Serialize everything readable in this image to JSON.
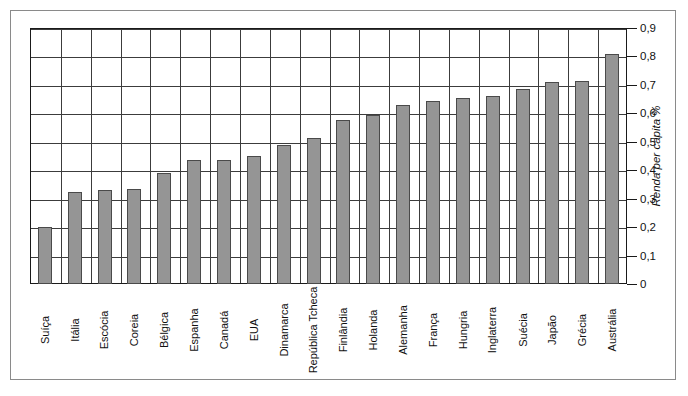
{
  "chart_data": {
    "type": "bar",
    "title": "",
    "xlabel": "",
    "ylabel": "Renda per capita %",
    "ylim": [
      0,
      0.9
    ],
    "grid": true,
    "legend": "none",
    "decimal_separator": ",",
    "categories": [
      "Suíça",
      "Itália",
      "Escócia",
      "Coreia",
      "Bélgica",
      "Espanha",
      "Canadá",
      "EUA",
      "Dinamarca",
      "República Tcheca",
      "Finlândia",
      "Holanda",
      "Alemanha",
      "França",
      "Hungria",
      "Inglaterra",
      "Suécia",
      "Japão",
      "Grécia",
      "Austrália"
    ],
    "values": [
      0.2,
      0.325,
      0.33,
      0.335,
      0.39,
      0.435,
      0.435,
      0.45,
      0.49,
      0.515,
      0.575,
      0.595,
      0.63,
      0.645,
      0.655,
      0.66,
      0.685,
      0.71,
      0.715,
      0.81
    ],
    "yticks": [
      0,
      0.1,
      0.2,
      0.3,
      0.4,
      0.5,
      0.6,
      0.7,
      0.8,
      0.9
    ],
    "ytick_labels": [
      "0",
      "0,1",
      "0,2",
      "0,3",
      "0,4",
      "0,5",
      "0,6",
      "0,7",
      "0,8",
      "0,9"
    ],
    "bar_color": "#959595",
    "bar_border_color": "#4a4a4a",
    "grid_color": "#3c3c3c",
    "axis_color": "#1a1a1a",
    "frame_color": "#8a8a8a",
    "background": "#ffffff"
  }
}
